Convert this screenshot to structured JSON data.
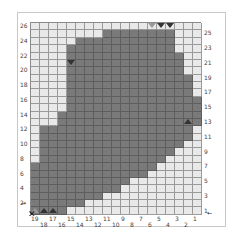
{
  "pattern": {
    "columns": 19,
    "rows": 26,
    "row_labels_left": [
      "26",
      "24",
      "22",
      "20",
      "18",
      "16",
      "14",
      "12",
      "10",
      "8",
      "6",
      "4",
      "2"
    ],
    "row_labels_right": [
      "25",
      "23",
      "21",
      "19",
      "17",
      "15",
      "13",
      "11",
      "9",
      "7",
      "5",
      "3",
      "1"
    ],
    "col_labels_bottom_upper": [
      "19",
      "17",
      "15",
      "13",
      "11",
      "9",
      "7",
      "5",
      "3",
      "1"
    ],
    "col_labels_bottom_lower": [
      "18",
      "16",
      "14",
      "12",
      "10",
      "8",
      "6",
      "4",
      "2"
    ],
    "filled_rows": [
      [],
      [
        8,
        15
      ],
      [
        5,
        15
      ],
      [
        4,
        15
      ],
      [
        4,
        16
      ],
      [
        4,
        16
      ],
      [
        4,
        16
      ],
      [
        4,
        17
      ],
      [
        4,
        17
      ],
      [
        4,
        17
      ],
      [
        4,
        18
      ],
      [
        4,
        18
      ],
      [
        3,
        18
      ],
      [
        3,
        18
      ],
      [
        1,
        17
      ],
      [
        1,
        17
      ],
      [
        1,
        16
      ],
      [
        1,
        15
      ],
      [
        1,
        14
      ],
      [
        0,
        13
      ],
      [
        0,
        12
      ],
      [
        0,
        10
      ],
      [
        0,
        9
      ],
      [
        0,
        7
      ],
      [
        0,
        5
      ],
      [
        0,
        3
      ]
    ],
    "colors": {
      "filled": "#7a7a7a",
      "empty": "#e9e9e9",
      "grid_line": "#9a9a9a",
      "frame": "#c8c8c8"
    },
    "markers": [
      {
        "type": "triangle-down",
        "col": 13,
        "row": 0,
        "shade": "light"
      },
      {
        "type": "triangle-down",
        "col": 14,
        "row": 0,
        "shade": "dark"
      },
      {
        "type": "triangle-down",
        "col": 15,
        "row": 0,
        "shade": "dark"
      },
      {
        "type": "triangle-down",
        "col": 4,
        "row": 5,
        "shade": "dark"
      },
      {
        "type": "triangle-up",
        "col": 17,
        "row": 13,
        "shade": "dark"
      },
      {
        "type": "triangle-up",
        "col": 0,
        "row": 25,
        "shade": "hollow"
      },
      {
        "type": "triangle-up",
        "col": 1,
        "row": 25,
        "shade": "dark"
      },
      {
        "type": "triangle-up",
        "col": 2,
        "row": 25,
        "shade": "dark"
      }
    ],
    "start_arrow_left": "→",
    "start_arrow_right": "←",
    "start_mark": "✕"
  }
}
